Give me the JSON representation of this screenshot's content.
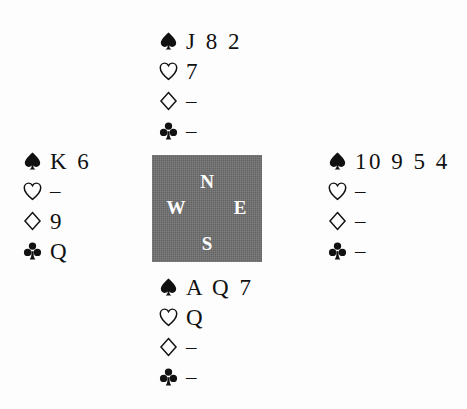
{
  "diagram": {
    "type": "bridge-hand-diagram",
    "ink_color": "#111111",
    "compass_box_color": "#6f6f6f",
    "compass_letter_color": "#ffffff",
    "background_color": "#fdfdfd",
    "void_symbol": "–"
  },
  "compass": {
    "north": "N",
    "west": "W",
    "east": "E",
    "south": "S"
  },
  "suits": {
    "spade": {
      "name": "spade",
      "icon": "spade-icon",
      "fill": "solid"
    },
    "heart": {
      "name": "heart",
      "icon": "heart-icon",
      "fill": "outline"
    },
    "diamond": {
      "name": "diamond",
      "icon": "diamond-icon",
      "fill": "outline"
    },
    "club": {
      "name": "club",
      "icon": "club-icon",
      "fill": "solid"
    }
  },
  "hands": {
    "north": {
      "position": "North",
      "spades": "J 8 2",
      "hearts": "7",
      "diamonds": "–",
      "clubs": "–"
    },
    "west": {
      "position": "West",
      "spades": "K 6",
      "hearts": "–",
      "diamonds": "9",
      "clubs": "Q"
    },
    "east": {
      "position": "East",
      "spades": "10 9 5 4",
      "hearts": "–",
      "diamonds": "–",
      "clubs": "–"
    },
    "south": {
      "position": "South",
      "spades": "A Q 7",
      "hearts": "Q",
      "diamonds": "–",
      "clubs": "–"
    }
  }
}
